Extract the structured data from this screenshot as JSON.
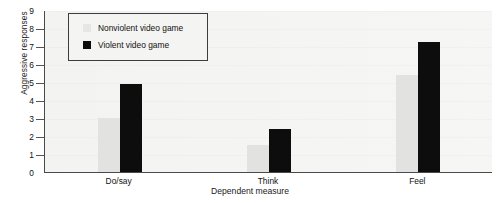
{
  "chart_data": {
    "type": "bar",
    "title": "",
    "xlabel": "Dependent measure",
    "ylabel": "Aggressive responses",
    "categories": [
      "Do/say",
      "Think",
      "Feel"
    ],
    "series": [
      {
        "name": "Nonviolent video game",
        "color": "#e2e2e0",
        "values": [
          3.0,
          1.5,
          5.4
        ]
      },
      {
        "name": "Violent video game",
        "color": "#0d0d0d",
        "values": [
          4.9,
          2.4,
          7.2
        ]
      }
    ],
    "ylim": [
      0,
      9
    ],
    "ytick_labels": [
      "9",
      "8",
      "7",
      "6",
      "5",
      "4",
      "3",
      "2",
      "1",
      "0"
    ],
    "ytick_values": [
      9,
      8,
      7,
      6,
      5,
      4,
      3,
      2,
      1,
      0
    ],
    "grid": false,
    "legend_position": "top-left"
  },
  "legend": {
    "entries": [
      {
        "label": "Nonviolent video game",
        "swatch": "nonviolent"
      },
      {
        "label": "Violent video game",
        "swatch": "violent"
      }
    ]
  }
}
